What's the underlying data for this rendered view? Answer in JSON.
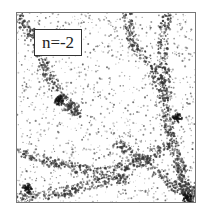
{
  "panel": {
    "label": "n=-2",
    "frame_color": "#777777",
    "particle_color": "#333333",
    "description": "Simulated matter density field showing filaments and clusters"
  }
}
